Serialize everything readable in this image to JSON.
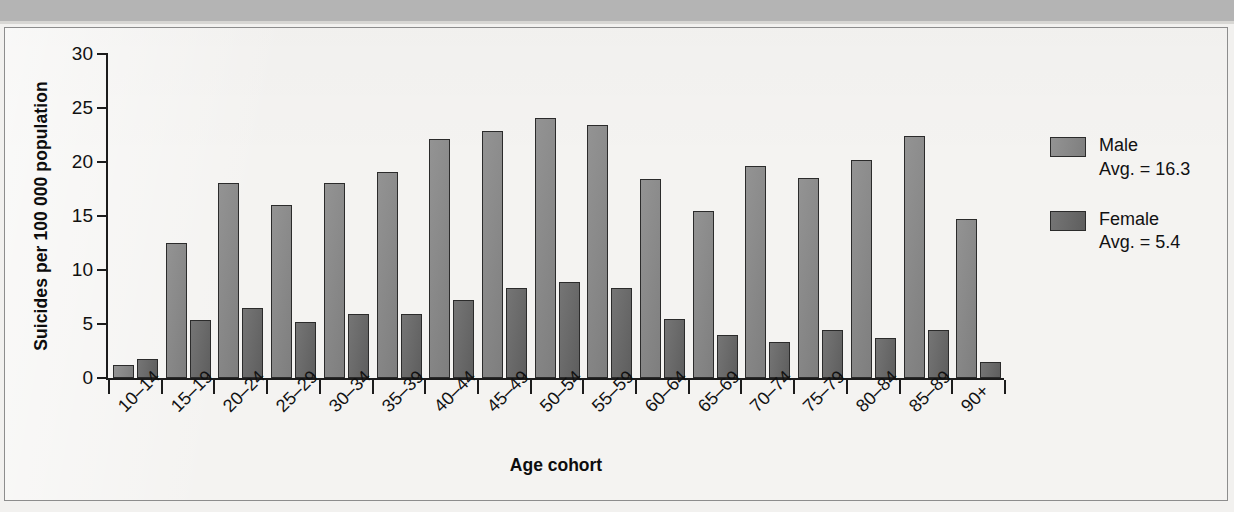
{
  "chart_data": {
    "type": "bar",
    "title": "",
    "xlabel": "Age cohort",
    "ylabel": "Suicides per 100 000 population",
    "ylim": [
      0,
      30
    ],
    "yticks": [
      0,
      5,
      10,
      15,
      20,
      25,
      30
    ],
    "grid": false,
    "legend_position": "right",
    "categories": [
      "10–14",
      "15–19",
      "20–24",
      "25–29",
      "30–34",
      "35–39",
      "40–44",
      "45–49",
      "50–54",
      "55–59",
      "60–64",
      "65–69",
      "70–74",
      "75–79",
      "80–84",
      "85–89",
      "90+"
    ],
    "series": [
      {
        "name": "Male",
        "color": "#8a8a8a",
        "average": 16.3,
        "values": [
          1.2,
          12.5,
          18.1,
          16.0,
          18.1,
          19.1,
          22.1,
          22.9,
          24.1,
          23.4,
          18.4,
          15.5,
          19.6,
          18.5,
          20.2,
          22.4,
          14.7
        ]
      },
      {
        "name": "Female",
        "color": "#6b6b6b",
        "average": 5.4,
        "values": [
          1.8,
          5.4,
          6.5,
          5.2,
          5.9,
          5.9,
          7.2,
          8.3,
          8.9,
          8.3,
          5.5,
          4.0,
          3.3,
          4.4,
          3.7,
          4.4,
          1.5
        ]
      }
    ]
  },
  "legend": {
    "entries": [
      {
        "name": "Male",
        "avg_label": "Avg. = 16.3"
      },
      {
        "name": "Female",
        "avg_label": "Avg. = 5.4"
      }
    ]
  },
  "axis": {
    "y_title": "Suicides per 100 000 population",
    "x_title": "Age cohort"
  }
}
